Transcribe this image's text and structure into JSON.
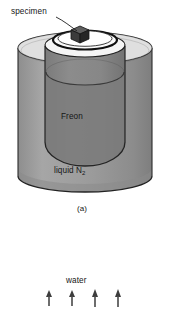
{
  "figure": {
    "domain_kind": "technical-illustration",
    "panel_a": {
      "caption": "(a)",
      "labels": {
        "specimen": "specimen",
        "freon": "Freon",
        "liquid_n2_text": "liquid N",
        "liquid_n2_sub": "2"
      },
      "objects": {
        "outer_vessel": "liquid-nitrogen-dewar",
        "inner_vessel": "freon-beaker",
        "sample": "specimen-cube"
      }
    },
    "panel_b": {
      "labels": {
        "water": "water"
      },
      "arrows": {
        "count": 4,
        "direction": "up",
        "positions_x": [
          49,
          72,
          95,
          118
        ]
      }
    },
    "colors": {
      "ink": "#1a1a1a",
      "outline": "#262626",
      "liquid_n2_fill": "#9a9a9a",
      "liquid_n2_fill_light": "#b0b0b0",
      "freon_fill": "#868686",
      "freon_fill_dark": "#787878",
      "beaker_top": "#f2f2f2",
      "specimen_fill": "#3a3a3a",
      "specimen_top": "#5a5a5a",
      "specimen_side": "#2a2a2a",
      "background": "#ffffff"
    }
  }
}
